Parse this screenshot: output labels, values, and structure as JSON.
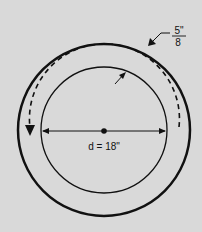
{
  "diagram": {
    "background": "#d9d9d9",
    "stroke_color": "#111111",
    "thickness_label": {
      "numerator": "5\"",
      "denominator": "8"
    },
    "diameter_label": "d = 18\"",
    "elements": [
      "outer-circle",
      "inner-circle",
      "dashed-arc-arrow",
      "diameter-line",
      "center-point",
      "small-arrow"
    ]
  }
}
